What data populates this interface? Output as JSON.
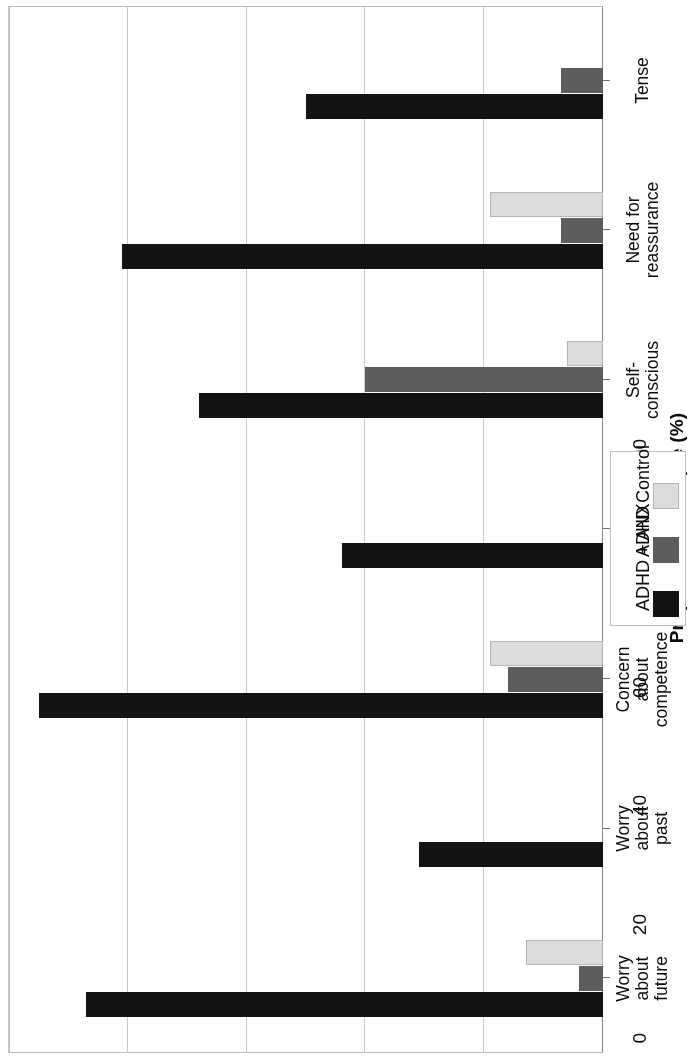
{
  "chart_data": {
    "type": "bar",
    "orientation": "horizontal",
    "title": "",
    "xlabel": "",
    "ylabel": "Proportion of sample (%)",
    "value_axis_label": "Proportion of sample (%)",
    "ylim": [
      0,
      100
    ],
    "ticks": [
      "0",
      "20",
      "40",
      "60",
      "80",
      "100"
    ],
    "tick_values": [
      0,
      20,
      40,
      60,
      80,
      100
    ],
    "grid": true,
    "legend_position": "left-middle",
    "categories": [
      "Worry about future",
      "Worry about past",
      "Concern about competence",
      "Physical complaint",
      "Self-conscious",
      "Need for reassurance",
      "Tense"
    ],
    "category_lines": [
      [
        "Worry",
        "about",
        "future"
      ],
      [
        "Worry",
        "about",
        "past"
      ],
      [
        "Concern",
        "about",
        "competence"
      ],
      [
        "Physical",
        "complaint"
      ],
      [
        "Self-",
        "conscious"
      ],
      [
        "Need for",
        "reassurance"
      ],
      [
        "Tense"
      ]
    ],
    "series": [
      {
        "name": "ADHD + ANX",
        "color": "#131313",
        "values": [
          87,
          31,
          95,
          44,
          68,
          81,
          50
        ]
      },
      {
        "name": "ADHD",
        "color": "#5d5d5d",
        "values": [
          4,
          0,
          16,
          0,
          40,
          7,
          7
        ]
      },
      {
        "name": "Control",
        "color": "#dcdcdc",
        "values": [
          13,
          0,
          19,
          0,
          6,
          19,
          0
        ]
      }
    ]
  },
  "legend": {
    "entries": [
      {
        "label": "ADHD + ANX",
        "color": "#131313"
      },
      {
        "label": "ADHD",
        "color": "#5d5d5d"
      },
      {
        "label": "Control",
        "color": "#dcdcdc"
      }
    ]
  }
}
